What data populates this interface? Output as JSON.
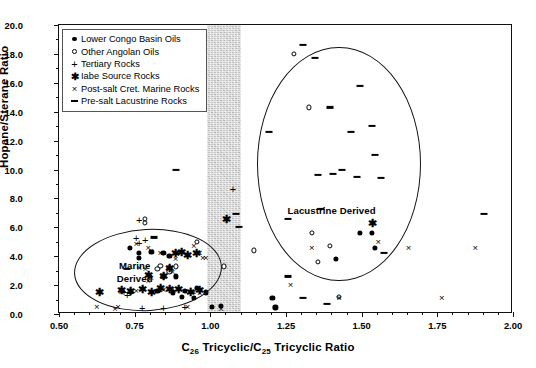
{
  "chart_data": {
    "type": "scatter",
    "title": "",
    "xlabel": "C26 Tricyclic/C25 Tricyclic Ratio",
    "ylabel": "Hopane/Sterane Ratio",
    "xlim": [
      0.5,
      2.0
    ],
    "ylim": [
      0.0,
      20.0
    ],
    "xticks": [
      "0.50",
      "0.75",
      "1.00",
      "1.25",
      "1.50",
      "1.75",
      "2.00"
    ],
    "yticks": [
      "0.0",
      "2.0",
      "4.0",
      "6.0",
      "8.0",
      "10.0",
      "12.0",
      "14.0",
      "16.0",
      "18.0",
      "20.0"
    ],
    "grid": false,
    "legend_position": "upper-left",
    "annotations": [
      {
        "text": "Marine\nDerived",
        "x": 0.78,
        "y": 2.9
      },
      {
        "text": "Lacustrine Derived",
        "x": 1.34,
        "y": 7.2
      }
    ],
    "shaded_band": {
      "x_start": 0.99,
      "x_end": 1.1,
      "color": "#b9b9b9"
    },
    "envelopes": [
      {
        "label": "Marine Derived",
        "cx": 0.795,
        "cy": 3.0,
        "rx": 0.245,
        "ry": 2.85
      },
      {
        "label": "Lacustrine Derived",
        "cx": 1.425,
        "cy": 10.4,
        "rx": 0.27,
        "ry": 8.1
      }
    ],
    "series": [
      {
        "name": "Lower Congo Basin Oils",
        "marker": "filled-circle",
        "color": "#000000",
        "points": [
          [
            0.735,
            4.6
          ],
          [
            0.765,
            4.2
          ],
          [
            0.765,
            3.9
          ],
          [
            0.805,
            4.3
          ],
          [
            0.845,
            4.2
          ],
          [
            0.865,
            4.0
          ],
          [
            0.885,
            2.6
          ],
          [
            0.825,
            1.6
          ],
          [
            0.875,
            1.5
          ],
          [
            0.915,
            1.6
          ],
          [
            0.955,
            1.8
          ],
          [
            0.985,
            1.5
          ],
          [
            1.005,
            0.5
          ],
          [
            1.035,
            0.55
          ],
          [
            1.205,
            1.1
          ],
          [
            1.215,
            0.45
          ],
          [
            1.415,
            3.8
          ],
          [
            1.495,
            5.6
          ],
          [
            1.535,
            5.6
          ],
          [
            1.545,
            4.6
          ],
          [
            0.905,
            1.2
          ],
          [
            0.945,
            1.1
          ]
        ]
      },
      {
        "name": "Other Angolan Oils",
        "marker": "open-circle",
        "color": "#000000",
        "points": [
          [
            0.955,
            5.0
          ],
          [
            0.885,
            3.3
          ],
          [
            0.865,
            3.2
          ],
          [
            0.835,
            3.35
          ],
          [
            0.825,
            3.1
          ],
          [
            0.845,
            2.6
          ],
          [
            0.865,
            2.95
          ],
          [
            0.785,
            6.6
          ],
          [
            0.785,
            6.3
          ],
          [
            1.045,
            3.3
          ],
          [
            1.275,
            18.0
          ],
          [
            1.325,
            14.3
          ],
          [
            1.335,
            5.6
          ],
          [
            1.355,
            3.6
          ],
          [
            1.395,
            4.7
          ],
          [
            1.425,
            1.2
          ],
          [
            1.145,
            4.4
          ]
        ]
      },
      {
        "name": "Tertiary Rocks",
        "marker": "plus",
        "color": "#000000",
        "points": [
          [
            0.755,
            5.2
          ],
          [
            0.765,
            4.9
          ],
          [
            0.715,
            1.5
          ],
          [
            0.725,
            1.3
          ],
          [
            0.775,
            0.35
          ],
          [
            0.845,
            0.35
          ],
          [
            0.915,
            0.45
          ],
          [
            0.935,
            1.6
          ],
          [
            0.765,
            6.5
          ],
          [
            0.785,
            5.1
          ],
          [
            1.075,
            8.6
          ],
          [
            0.735,
            1.45
          ]
        ]
      },
      {
        "name": "Iabe Source Rocks",
        "marker": "asterisk",
        "color": "#000000",
        "points": [
          [
            0.635,
            1.55
          ],
          [
            0.705,
            1.65
          ],
          [
            0.735,
            1.6
          ],
          [
            0.775,
            1.7
          ],
          [
            0.805,
            1.55
          ],
          [
            0.835,
            1.8
          ],
          [
            0.865,
            3.2
          ],
          [
            0.885,
            4.2
          ],
          [
            0.905,
            4.3
          ],
          [
            0.925,
            4.1
          ],
          [
            0.865,
            1.75
          ],
          [
            0.895,
            1.75
          ],
          [
            0.965,
            1.65
          ],
          [
            0.935,
            1.5
          ],
          [
            0.845,
            2.6
          ],
          [
            0.795,
            2.7
          ],
          [
            1.055,
            6.6
          ],
          [
            1.535,
            6.3
          ],
          [
            0.955,
            4.2
          ]
        ]
      },
      {
        "name": "Post-salt Cret. Marine Rocks",
        "marker": "x",
        "color": "#000000",
        "points": [
          [
            0.625,
            0.45
          ],
          [
            0.695,
            0.5
          ],
          [
            0.705,
            1.55
          ],
          [
            0.755,
            4.85
          ],
          [
            0.795,
            4.6
          ],
          [
            0.805,
            4.35
          ],
          [
            0.835,
            4.2
          ],
          [
            0.885,
            3.8
          ],
          [
            0.945,
            4.7
          ],
          [
            0.965,
            4.2
          ],
          [
            0.985,
            3.9
          ],
          [
            0.805,
            2.5
          ],
          [
            0.795,
            2.25
          ],
          [
            0.765,
            3.2
          ],
          [
            0.785,
            3.1
          ],
          [
            0.845,
            1.65
          ],
          [
            0.875,
            1.7
          ],
          [
            0.915,
            1.6
          ],
          [
            0.945,
            1.55
          ],
          [
            0.965,
            1.45
          ],
          [
            0.925,
            0.5
          ],
          [
            0.685,
            0.35
          ],
          [
            0.755,
            1.6
          ],
          [
            1.035,
            0.35
          ],
          [
            1.265,
            2.0
          ],
          [
            1.335,
            4.6
          ],
          [
            1.555,
            5.0
          ],
          [
            1.655,
            4.6
          ],
          [
            1.875,
            4.6
          ],
          [
            1.765,
            1.1
          ],
          [
            1.425,
            1.1
          ],
          [
            0.875,
            2.9
          ],
          [
            0.975,
            3.9
          ]
        ]
      },
      {
        "name": "Pre-salt Lacustrine Rocks",
        "marker": "dash",
        "color": "#000000",
        "points": [
          [
            0.725,
            3.1
          ],
          [
            0.885,
            10.0
          ],
          [
            0.815,
            5.3
          ],
          [
            1.085,
            6.9
          ],
          [
            1.095,
            6.0
          ],
          [
            1.195,
            12.6
          ],
          [
            1.255,
            6.6
          ],
          [
            1.305,
            18.6
          ],
          [
            1.345,
            17.7
          ],
          [
            1.395,
            14.3
          ],
          [
            1.405,
            9.7
          ],
          [
            1.435,
            10.0
          ],
          [
            1.465,
            12.6
          ],
          [
            1.485,
            9.5
          ],
          [
            1.495,
            15.8
          ],
          [
            1.535,
            13.0
          ],
          [
            1.545,
            11.0
          ],
          [
            1.565,
            9.4
          ],
          [
            1.575,
            4.2
          ],
          [
            1.365,
            7.3
          ],
          [
            1.305,
            1.1
          ],
          [
            1.385,
            0.7
          ],
          [
            1.255,
            2.6
          ],
          [
            1.905,
            6.9
          ],
          [
            1.355,
            9.6
          ]
        ]
      }
    ]
  },
  "legend": {
    "items": [
      {
        "label": "Lower Congo Basin Oils",
        "marker": "dot"
      },
      {
        "label": "Other Angolan Oils",
        "marker": "circ"
      },
      {
        "label": "Tertiary Rocks",
        "marker": "plus"
      },
      {
        "label": "Iabe Source Rocks",
        "marker": "star"
      },
      {
        "label": "Post-salt Cret. Marine Rocks",
        "marker": "ex"
      },
      {
        "label": "Pre-salt Lacustrine Rocks",
        "marker": "dash"
      }
    ]
  },
  "axes": {
    "y_title": "Hopane/Sterane Ratio",
    "x_title_main": "Tricyclic/C",
    "x_title_pre": "C",
    "x_title_sub1": "26",
    "x_title_sub2": "25",
    "x_title_post": " Tricyclic Ratio"
  },
  "annotations": {
    "marine_line1": "Marine",
    "marine_line2": "Derived",
    "lacustrine": "Lacustrine Derived"
  }
}
